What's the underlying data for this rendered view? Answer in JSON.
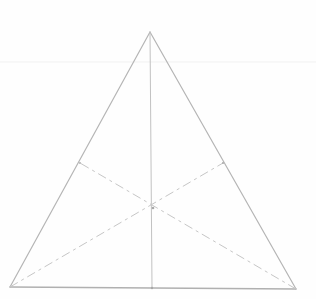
{
  "diagram": {
    "description": "Pencil sketch of a triangle with its three medians meeting at the centroid",
    "style": {
      "stroke_color": "#b8b8b8",
      "median_color": "#c4c4c4",
      "guide_color": "#f1f1f1",
      "background": "#fefefe"
    },
    "vertices": {
      "apex": [
        150,
        32
      ],
      "bottom_left": [
        10,
        287
      ],
      "bottom_right": [
        296,
        289
      ]
    },
    "midpoints": {
      "base": [
        152,
        288
      ],
      "left_side": [
        80,
        163
      ],
      "right_side": [
        223,
        163
      ]
    },
    "centroid": [
      153,
      208
    ],
    "guide_line_y": 62,
    "medians": [
      {
        "from": "apex",
        "to": "base",
        "style": "solid"
      },
      {
        "from": "bottom_left",
        "to": "right_side",
        "style": "dashed"
      },
      {
        "from": "bottom_right",
        "to": "left_side",
        "style": "dashed"
      }
    ]
  }
}
